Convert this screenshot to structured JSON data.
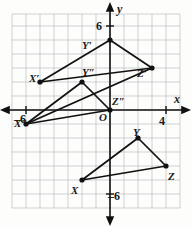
{
  "figure": {
    "grid": {
      "visible": true,
      "cell_units": 1,
      "x_min": -7,
      "x_max": 5,
      "y_min": -7,
      "y_max": 7,
      "grid_color": "#b9bfc4",
      "axis_color": "#111111",
      "background": "#fdfdfb"
    },
    "axes": {
      "x_label": "x",
      "y_label": "y",
      "origin_label": "O",
      "x_ticks": [
        {
          "label": "–6",
          "value": -6
        },
        {
          "label": "4",
          "value": 4
        }
      ],
      "y_ticks": [
        {
          "label": "6",
          "value": 6
        },
        {
          "label": "–6",
          "value": -6
        }
      ]
    },
    "shapes": [
      {
        "name": "triangle-xyz",
        "vertices": [
          {
            "label": "X",
            "x": -2,
            "y": -5
          },
          {
            "label": "Y",
            "x": 2,
            "y": -2
          },
          {
            "label": "Z",
            "x": 4,
            "y": -4
          }
        ],
        "stroke": "#111111"
      },
      {
        "name": "triangle-x-prime",
        "vertices": [
          {
            "label": "X′",
            "x": -5,
            "y": 2
          },
          {
            "label": "Y′",
            "x": 0,
            "y": 5
          },
          {
            "label": "Z′",
            "x": 3,
            "y": 3
          }
        ],
        "stroke": "#111111"
      },
      {
        "name": "triangle-x-double-prime",
        "vertices": [
          {
            "label": "X″",
            "x": -6,
            "y": -1
          },
          {
            "label": "Y″",
            "x": -2,
            "y": 2
          },
          {
            "label": "Z″",
            "x": 0,
            "y": 0
          }
        ],
        "stroke": "#111111"
      }
    ],
    "point_labels": [
      {
        "text": "Y′",
        "left": 82,
        "top": 40
      },
      {
        "text": "Z′",
        "left": 137,
        "top": 68
      },
      {
        "text": "X′",
        "left": 29,
        "top": 73
      },
      {
        "text": "Y″",
        "left": 82,
        "top": 67
      },
      {
        "text": "Z″",
        "left": 112,
        "top": 96
      },
      {
        "text": "X″",
        "left": 14,
        "top": 118
      },
      {
        "text": "Y",
        "left": 133,
        "top": 127
      },
      {
        "text": "Z",
        "left": 168,
        "top": 171
      },
      {
        "text": "X",
        "left": 71,
        "top": 185
      }
    ],
    "axis_labels": [
      {
        "text": "y",
        "left": 117,
        "top": 3
      },
      {
        "text": "x",
        "left": 174,
        "top": 93
      }
    ],
    "tick_labels": [
      {
        "text": "6",
        "left": 96,
        "top": 20
      },
      {
        "text": "4",
        "left": 159,
        "top": 115
      },
      {
        "text": "–6",
        "left": 14,
        "top": 113
      },
      {
        "text": "–6",
        "left": 108,
        "top": 190
      },
      {
        "text": "O",
        "left": 99,
        "top": 112
      }
    ]
  }
}
